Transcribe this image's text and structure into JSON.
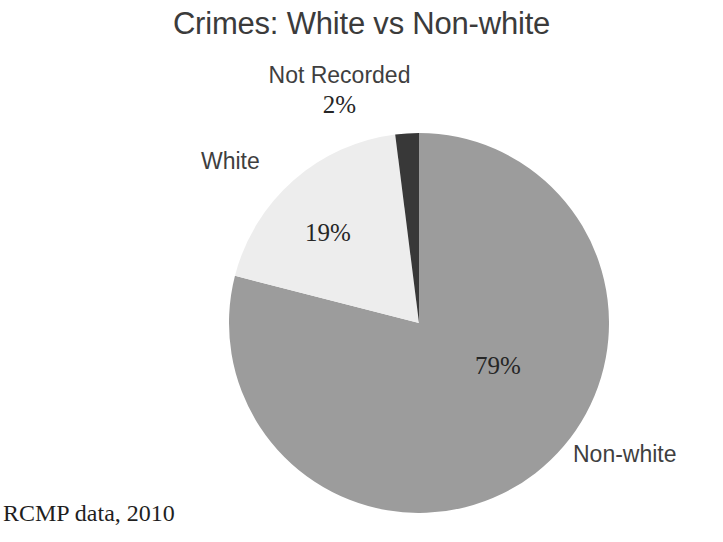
{
  "slide": {
    "background_color": "#ffffff",
    "title": "Crimes: White vs Non-white",
    "source_caption": "RCMP data, 2010"
  },
  "chart_data": {
    "type": "pie",
    "title": "Crimes: White vs Non-white",
    "subtitle": "",
    "xlabel": "",
    "ylabel": "",
    "legend_position": "none",
    "grid": false,
    "start_angle_deg": 0,
    "direction": "clockwise",
    "categories": [
      "Non-white",
      "White",
      "Not Recorded"
    ],
    "values": [
      79,
      19,
      2
    ],
    "value_unit": "percent",
    "labels": [
      "79%",
      "19%",
      "2%"
    ],
    "colors": [
      "#9c9c9c",
      "#ededed",
      "#383838"
    ],
    "slices": [
      {
        "name": "Non-white",
        "value": 79,
        "label": "79%",
        "color": "#9c9c9c",
        "start_deg": 0,
        "end_deg": 284.4
      },
      {
        "name": "White",
        "value": 19,
        "label": "19%",
        "color": "#ededed",
        "start_deg": 284.4,
        "end_deg": 352.8
      },
      {
        "name": "Not Recorded",
        "value": 2,
        "label": "2%",
        "color": "#383838",
        "start_deg": 352.8,
        "end_deg": 360
      }
    ],
    "annotations": [
      "RCMP data, 2010"
    ]
  },
  "labels": {
    "not_recorded_name": "Not Recorded",
    "not_recorded_pct": "2%",
    "white_name": "White",
    "white_pct": "19%",
    "non_white_name": "Non-white",
    "non_white_pct": "79%"
  },
  "colors": {
    "non_white_slice": "#9c9c9c",
    "white_slice": "#ededed",
    "not_recorded_slice": "#383838",
    "title_text": "#3b3b3b",
    "category_text": "#3f3f3f",
    "percent_text": "#262626",
    "caption_text": "#1f1f1f"
  }
}
